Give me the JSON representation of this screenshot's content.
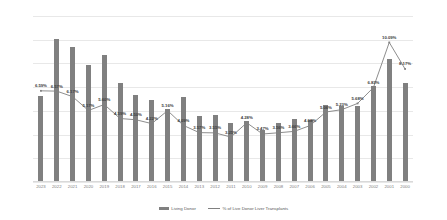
{
  "chart_data": {
    "type": "bar",
    "title": "",
    "xlabel": "",
    "ylabel": "",
    "ylim": [
      0,
      700
    ],
    "y2lim": [
      0,
      12
    ],
    "grid": true,
    "legend_position": "bottom",
    "categories": [
      "2023",
      "2022",
      "2021",
      "2020",
      "2019",
      "2018",
      "2017",
      "2016",
      "2015",
      "2014",
      "2013",
      "2012",
      "2011",
      "2010",
      "2009",
      "2008",
      "2007",
      "2006",
      "2005",
      "2004",
      "2003",
      "2002",
      "2001",
      "2000"
    ],
    "y_ticks": [
      "0",
      "100",
      "200",
      "300",
      "400",
      "500",
      "600",
      "700"
    ],
    "y2_ticks": [
      "0.00%",
      "2.00%",
      "4.00%",
      "6.00%",
      "8.00%",
      "10.00%",
      "12.00%"
    ],
    "series": [
      {
        "name": "Living Donor",
        "type": "bar",
        "axis": "left",
        "color": "#808080",
        "values": [
          363,
          603,
          569,
          492,
          537,
          416,
          367,
          345,
          310,
          359,
          279,
          281,
          247,
          256,
          219,
          249,
          266,
          262,
          323,
          322,
          321,
          404,
          519,
          418
        ]
      },
      {
        "name": "% of Live Donor Liver Transplants",
        "type": "line",
        "axis": "right",
        "color": "#808080",
        "values": [
          6.59,
          6.57,
          6.17,
          5.17,
          5.6,
          4.59,
          4.5,
          4.22,
          5.16,
          4.09,
          3.57,
          3.55,
          3.25,
          4.28,
          3.47,
          3.56,
          3.66,
          4.08,
          5.06,
          5.23,
          5.68,
          6.83,
          10.09,
          8.17
        ],
        "labels": [
          "6.59%",
          "6.57%",
          "6.17%",
          "5.17%",
          "5.60%",
          "4.59%",
          "4.50%",
          "4.22%",
          "5.16%",
          "4.09%",
          "3.57%",
          "3.55%",
          "3.25%",
          "4.28%",
          "3.47%",
          "3.56%",
          "3.66%",
          "4.08%",
          "5.06%",
          "5.23%",
          "5.68%",
          "6.83%",
          "10.09%",
          "8.17%"
        ]
      }
    ],
    "legend": [
      {
        "label": "Living Donor",
        "marker": "bar",
        "color": "#808080"
      },
      {
        "label": "% of Live Donor Liver Transplants",
        "marker": "line",
        "color": "#808080"
      }
    ]
  }
}
